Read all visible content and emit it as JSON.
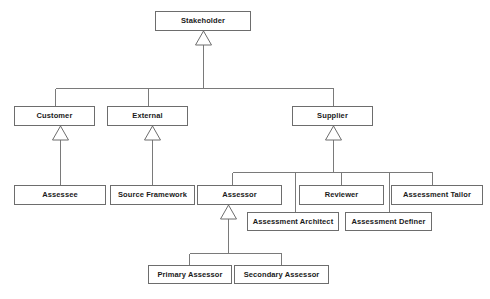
{
  "diagram": {
    "kind": "uml-class-generalization-hierarchy",
    "caption": "",
    "colors": {
      "background": "#ffffff",
      "box_fill": "#ffffff",
      "box_border": "#6d6d6d",
      "connector": "#7a7a7a",
      "text": "#1a1a1a"
    },
    "nodes": [
      {
        "id": "stakeholder",
        "label": "Stakeholder",
        "x": 155,
        "y": 11,
        "w": 96,
        "h": 20
      },
      {
        "id": "customer",
        "label": "Customer",
        "x": 14,
        "y": 106,
        "w": 81,
        "h": 20
      },
      {
        "id": "external",
        "label": "External",
        "x": 107,
        "y": 106,
        "w": 81,
        "h": 20
      },
      {
        "id": "supplier",
        "label": "Supplier",
        "x": 292,
        "y": 106,
        "w": 81,
        "h": 20
      },
      {
        "id": "assessee",
        "label": "Assessee",
        "x": 14,
        "y": 185,
        "w": 92,
        "h": 20
      },
      {
        "id": "source-framework",
        "label": "Source Framework",
        "x": 110,
        "y": 185,
        "w": 85,
        "h": 20
      },
      {
        "id": "assessor",
        "label": "Assessor",
        "x": 197,
        "y": 185,
        "w": 85,
        "h": 20
      },
      {
        "id": "reviewer",
        "label": "Reviewer",
        "x": 299,
        "y": 185,
        "w": 85,
        "h": 20
      },
      {
        "id": "assessment-tailor",
        "label": "Assessment Tailor",
        "x": 391,
        "y": 185,
        "w": 92,
        "h": 20
      },
      {
        "id": "assessment-architect",
        "label": "Assessment Architect",
        "x": 247,
        "y": 212,
        "w": 92,
        "h": 19
      },
      {
        "id": "assessment-definer",
        "label": "Assessment Definer",
        "x": 345,
        "y": 212,
        "w": 87,
        "h": 19
      },
      {
        "id": "primary-assessor",
        "label": "Primary Assessor",
        "x": 148,
        "y": 265,
        "w": 84,
        "h": 19
      },
      {
        "id": "secondary-assessor",
        "label": "Secondary Assessor",
        "x": 234,
        "y": 265,
        "w": 95,
        "h": 19
      }
    ],
    "generalizations": [
      {
        "child": "customer",
        "parent": "stakeholder"
      },
      {
        "child": "external",
        "parent": "stakeholder"
      },
      {
        "child": "supplier",
        "parent": "stakeholder"
      },
      {
        "child": "assessee",
        "parent": "customer"
      },
      {
        "child": "source-framework",
        "parent": "external"
      },
      {
        "child": "assessor",
        "parent": "supplier"
      },
      {
        "child": "reviewer",
        "parent": "supplier"
      },
      {
        "child": "assessment-tailor",
        "parent": "supplier"
      },
      {
        "child": "assessment-architect",
        "parent": "supplier"
      },
      {
        "child": "assessment-definer",
        "parent": "supplier"
      },
      {
        "child": "primary-assessor",
        "parent": "assessor"
      },
      {
        "child": "secondary-assessor",
        "parent": "assessor"
      }
    ]
  }
}
